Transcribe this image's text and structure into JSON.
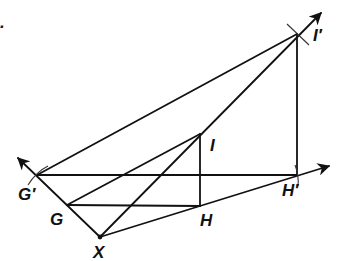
{
  "figure": {
    "marker": ".",
    "points": {
      "X": {
        "label": "X",
        "x": 100,
        "y": 237
      },
      "G": {
        "label": "G",
        "x": 67,
        "y": 205
      },
      "Gp": {
        "label": "G′",
        "x": 37,
        "y": 175
      },
      "H": {
        "label": "H",
        "x": 200,
        "y": 206
      },
      "Hp": {
        "label": "H′",
        "x": 297,
        "y": 175
      },
      "I": {
        "label": "I",
        "x": 200,
        "y": 134
      },
      "Ip": {
        "label": "I′",
        "x": 297,
        "y": 34
      }
    },
    "rays": [
      {
        "from": "X",
        "through": "Gp",
        "tip": [
          17,
          157
        ]
      },
      {
        "from": "X",
        "through": "Ip",
        "tip": [
          322,
          12
        ]
      },
      {
        "from": "X",
        "through": "Hp",
        "tip": [
          330,
          166
        ]
      }
    ],
    "segments": [
      [
        "G",
        "I"
      ],
      [
        "G",
        "H"
      ],
      [
        "H",
        "I"
      ],
      [
        "Gp",
        "Ip"
      ],
      [
        "Gp",
        "Hp"
      ],
      [
        "Hp",
        "Ip"
      ]
    ],
    "colors": {
      "stroke": "#111111",
      "background": "#ffffff"
    }
  }
}
